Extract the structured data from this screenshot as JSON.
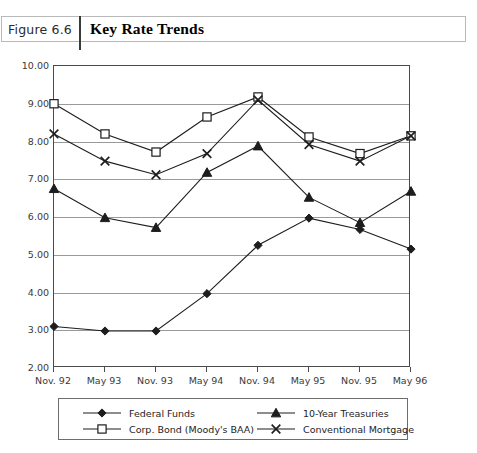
{
  "caption": {
    "figure_number": "Figure 6.6",
    "title": "Key Rate Trends"
  },
  "chart_data": {
    "type": "line",
    "title": "Key Rate Trends",
    "xlabel": "",
    "ylabel": "",
    "ylim": [
      2.0,
      10.0
    ],
    "ytick_step": 1.0,
    "grid": true,
    "legend_position": "bottom",
    "ytick_labels": [
      "10.00",
      "9.00",
      "8.00",
      "7.00",
      "6.00",
      "5.00",
      "4.00",
      "3.00",
      "2.00"
    ],
    "categories": [
      "Nov. 92",
      "May 93",
      "Nov. 93",
      "May 94",
      "Nov. 94",
      "May 95",
      "Nov. 95",
      "May 96"
    ],
    "series": [
      {
        "name": "Federal Funds",
        "marker": "filled-diamond",
        "color": "#1d1d1d",
        "values": [
          3.1,
          2.98,
          2.98,
          3.97,
          5.25,
          5.97,
          5.67,
          5.15
        ]
      },
      {
        "name": "Corp. Bond (Moody's BAA)",
        "marker": "open-square",
        "color": "#1d1d1d",
        "values": [
          9.0,
          8.2,
          7.72,
          8.65,
          9.18,
          8.12,
          7.68,
          8.15
        ]
      },
      {
        "name": "10-Year Treasuries",
        "marker": "filled-triangle",
        "color": "#1d1d1d",
        "values": [
          6.75,
          5.98,
          5.72,
          7.18,
          7.88,
          6.52,
          5.85,
          6.68
        ]
      },
      {
        "name": "Conventional Mortgage",
        "marker": "cross-x",
        "color": "#1d1d1d",
        "values": [
          8.2,
          7.48,
          7.12,
          7.68,
          9.1,
          7.92,
          7.48,
          8.15
        ]
      }
    ]
  }
}
